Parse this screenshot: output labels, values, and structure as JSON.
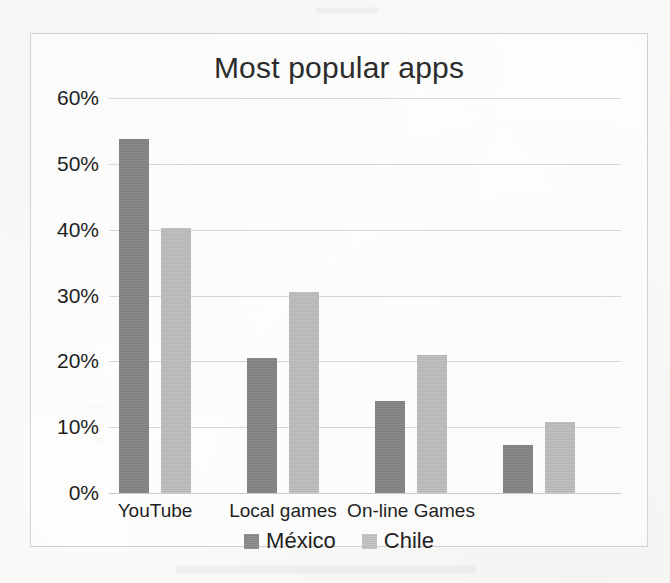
{
  "chart_data": {
    "type": "bar",
    "title": "Most popular apps",
    "xlabel": "",
    "ylabel": "",
    "ylim": [
      0,
      60
    ],
    "ytick_labels": [
      "0%",
      "10%",
      "20%",
      "30%",
      "40%",
      "50%",
      "60%"
    ],
    "ytick_values": [
      0,
      10,
      20,
      30,
      40,
      50,
      60
    ],
    "grid": true,
    "legend_position": "bottom",
    "categories": [
      "YouTube",
      "Local games",
      "On-line Games",
      ""
    ],
    "series": [
      {
        "name": "México",
        "color": "#848484",
        "values": [
          53.8,
          20.5,
          14.0,
          7.3
        ]
      },
      {
        "name": "Chile",
        "color": "#bcbcbc",
        "values": [
          40.2,
          30.5,
          20.9,
          10.8
        ]
      }
    ]
  },
  "legend": {
    "entries": [
      {
        "label": "México",
        "swatch": "mexico-swatch"
      },
      {
        "label": "Chile",
        "swatch": "chile-swatch"
      }
    ]
  }
}
